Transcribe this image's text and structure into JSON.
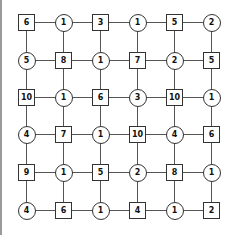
{
  "puzzle": {
    "rows": 6,
    "cols": 6,
    "cells": [
      [
        {
          "shape": "square",
          "value": "6"
        },
        {
          "shape": "circle",
          "value": "1"
        },
        {
          "shape": "square",
          "value": "3"
        },
        {
          "shape": "circle",
          "value": "1"
        },
        {
          "shape": "square",
          "value": "5"
        },
        {
          "shape": "circle",
          "value": "2"
        }
      ],
      [
        {
          "shape": "circle",
          "value": "5"
        },
        {
          "shape": "square",
          "value": "8"
        },
        {
          "shape": "circle",
          "value": "1"
        },
        {
          "shape": "square",
          "value": "7"
        },
        {
          "shape": "circle",
          "value": "2"
        },
        {
          "shape": "square",
          "value": "5"
        }
      ],
      [
        {
          "shape": "square",
          "value": "10"
        },
        {
          "shape": "circle",
          "value": "1"
        },
        {
          "shape": "square",
          "value": "6"
        },
        {
          "shape": "circle",
          "value": "3"
        },
        {
          "shape": "square",
          "value": "10"
        },
        {
          "shape": "circle",
          "value": "1"
        }
      ],
      [
        {
          "shape": "circle",
          "value": "4"
        },
        {
          "shape": "square",
          "value": "7"
        },
        {
          "shape": "circle",
          "value": "1"
        },
        {
          "shape": "square",
          "value": "10"
        },
        {
          "shape": "circle",
          "value": "4"
        },
        {
          "shape": "square",
          "value": "6"
        }
      ],
      [
        {
          "shape": "square",
          "value": "9"
        },
        {
          "shape": "circle",
          "value": "1"
        },
        {
          "shape": "square",
          "value": "5"
        },
        {
          "shape": "circle",
          "value": "2"
        },
        {
          "shape": "square",
          "value": "8"
        },
        {
          "shape": "circle",
          "value": "1"
        }
      ],
      [
        {
          "shape": "circle",
          "value": "4"
        },
        {
          "shape": "square",
          "value": "6"
        },
        {
          "shape": "circle",
          "value": "1"
        },
        {
          "shape": "square",
          "value": "4"
        },
        {
          "shape": "circle",
          "value": "1"
        },
        {
          "shape": "square",
          "value": "2"
        }
      ]
    ]
  },
  "colors": {
    "line": "#555555",
    "border": "#333333",
    "text": "#111111",
    "left_border": "#9a9a9a"
  }
}
